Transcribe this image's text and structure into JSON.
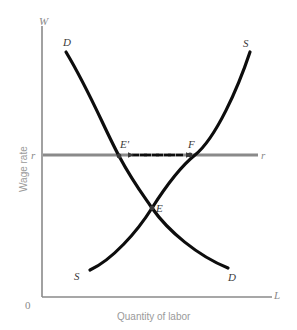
{
  "figure": {
    "type": "labor-market-supply-demand-diagram",
    "background_color": "#ffffff"
  },
  "axes": {
    "y_axis_tip_label": "W",
    "x_axis_tip_label": "L",
    "origin_label": "0",
    "y_axis_title": "Wage rate",
    "x_axis_title": "Quantity of labor",
    "axis_color": "#8a8a8a"
  },
  "curves": {
    "demand": {
      "name": "demand-curve",
      "top_label": "D",
      "bottom_label": "D",
      "color": "#0d0d0d",
      "path": "M 66,52 C 90,92 104,128 119,156 C 134,184 146,199 152,208 C 168,231 198,256 228,268"
    },
    "supply": {
      "name": "supply-curve",
      "bottom_label": "S",
      "top_label": "S",
      "color": "#0d0d0d",
      "path": "M 90,270 C 112,260 137,232 152,208 C 166,186 180,167 195,155 C 216,138 238,88 250,52"
    }
  },
  "wage_line": {
    "name": "minimum-wage-line",
    "left_label": "r",
    "right_label": "r",
    "color": "#8a8a8a",
    "y": 155,
    "x_start": 43,
    "x_end": 258
  },
  "points": [
    {
      "id": "e-prime",
      "label": "E'",
      "x": 119,
      "y": 156,
      "description": "quantity demanded at wage r"
    },
    {
      "id": "f",
      "label": "F",
      "x": 195,
      "y": 155,
      "description": "quantity supplied at wage r"
    },
    {
      "id": "e",
      "label": "E",
      "x": 152,
      "y": 208,
      "description": "market equilibrium"
    }
  ],
  "arrows": {
    "name": "surplus-gap-arrows",
    "style": "dashed-double-headed",
    "color": "#0d0d0d",
    "from_x": 195,
    "to_x": 119,
    "y": 155
  },
  "chart_data": {
    "type": "line",
    "title": "",
    "xlabel": "Quantity of labor",
    "ylabel": "Wage rate",
    "grid": false,
    "legend": "inline-curve-labels",
    "series": [
      {
        "name": "D",
        "label": "Demand",
        "points": [
          [
            66,
            52
          ],
          [
            119,
            156
          ],
          [
            152,
            208
          ],
          [
            228,
            268
          ]
        ]
      },
      {
        "name": "S",
        "label": "Supply",
        "points": [
          [
            90,
            270
          ],
          [
            152,
            208
          ],
          [
            195,
            155
          ],
          [
            250,
            52
          ]
        ]
      },
      {
        "name": "r",
        "label": "Wage floor r",
        "points": [
          [
            43,
            155
          ],
          [
            258,
            155
          ]
        ]
      }
    ],
    "annotations": [
      {
        "text": "E'",
        "x": 119,
        "y": 156
      },
      {
        "text": "F",
        "x": 195,
        "y": 155
      },
      {
        "text": "E",
        "x": 152,
        "y": 208
      },
      {
        "text": "W",
        "x": 42,
        "y": 22
      },
      {
        "text": "L",
        "x": 278,
        "y": 296
      },
      {
        "text": "0",
        "x": 28,
        "y": 306
      }
    ]
  }
}
